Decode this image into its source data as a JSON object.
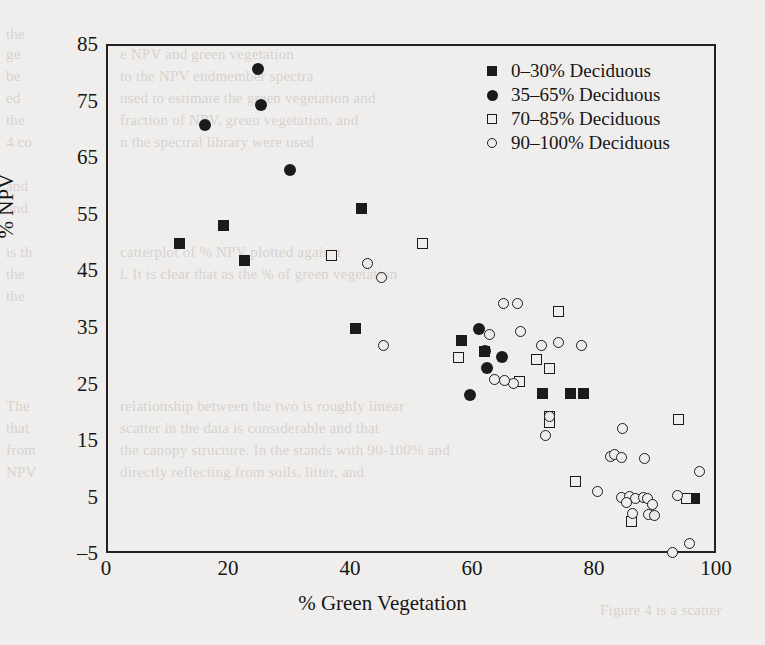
{
  "chart_data": {
    "type": "scatter",
    "title": "",
    "xlabel": "% Green Vegetation",
    "ylabel": "% NPV",
    "xlim": [
      0,
      100
    ],
    "ylim": [
      -5,
      85
    ],
    "xticks": [
      "0",
      "20",
      "40",
      "60",
      "80",
      "100"
    ],
    "yticks": [
      "85",
      "75",
      "65",
      "55",
      "45",
      "35",
      "25",
      "15",
      "5",
      "-5"
    ],
    "grid": false,
    "legend_position": "top-right",
    "series": [
      {
        "name": "0-30% Deciduous",
        "marker": "filled-square",
        "color": "#1b1b1b",
        "points": [
          [
            11.8,
            50.1
          ],
          [
            19.0,
            53.3
          ],
          [
            22.3,
            47.0
          ],
          [
            41.5,
            56.2
          ],
          [
            40.5,
            35.0
          ],
          [
            58.0,
            33.0
          ],
          [
            61.8,
            31.0
          ],
          [
            71.3,
            23.5
          ],
          [
            75.9,
            23.5
          ],
          [
            78.0,
            23.5
          ],
          [
            96.2,
            5.0
          ]
        ]
      },
      {
        "name": "35-65% Deciduous",
        "marker": "filled-circle",
        "color": "#1b1b1b",
        "points": [
          [
            24.6,
            81.0
          ],
          [
            25.1,
            74.6
          ],
          [
            15.9,
            71.0
          ],
          [
            29.8,
            63.0
          ],
          [
            60.8,
            35.0
          ],
          [
            61.8,
            31.0
          ],
          [
            64.6,
            30.0
          ],
          [
            62.1,
            28.0
          ],
          [
            59.4,
            23.3
          ]
        ]
      },
      {
        "name": "70-85% Deciduous",
        "marker": "open-square",
        "color": "#1b1b1b",
        "points": [
          [
            51.6,
            50.0
          ],
          [
            36.6,
            48.0
          ],
          [
            57.5,
            30.0
          ],
          [
            73.9,
            38.0
          ],
          [
            70.2,
            29.5
          ],
          [
            72.3,
            28.0
          ],
          [
            67.4,
            25.6
          ],
          [
            72.3,
            19.5
          ],
          [
            72.3,
            18.5
          ],
          [
            76.7,
            8.0
          ],
          [
            93.5,
            19.0
          ],
          [
            85.8,
            1.0
          ],
          [
            94.9,
            5.0
          ]
        ]
      },
      {
        "name": "90-100% Deciduous",
        "marker": "open-circle",
        "color": "#1b1b1b",
        "points": [
          [
            42.6,
            46.5
          ],
          [
            44.9,
            44.0
          ],
          [
            45.1,
            32.0
          ],
          [
            64.8,
            39.5
          ],
          [
            67.2,
            39.5
          ],
          [
            62.6,
            34.0
          ],
          [
            67.7,
            34.5
          ],
          [
            71.1,
            32.0
          ],
          [
            73.9,
            32.5
          ],
          [
            77.7,
            32.0
          ],
          [
            63.3,
            26.0
          ],
          [
            66.4,
            25.3
          ],
          [
            65.0,
            25.8
          ],
          [
            72.3,
            19.5
          ],
          [
            71.8,
            16.2
          ],
          [
            84.4,
            17.3
          ],
          [
            82.3,
            12.5
          ],
          [
            83.1,
            12.8
          ],
          [
            84.1,
            12.2
          ],
          [
            87.9,
            12.0
          ],
          [
            80.2,
            6.3
          ],
          [
            84.1,
            5.2
          ],
          [
            85.5,
            5.4
          ],
          [
            86.4,
            5.0
          ],
          [
            87.8,
            5.2
          ],
          [
            88.4,
            5.0
          ],
          [
            89.2,
            4.0
          ],
          [
            85.0,
            4.3
          ],
          [
            86.0,
            2.4
          ],
          [
            88.6,
            2.2
          ],
          [
            89.6,
            2.0
          ],
          [
            93.4,
            5.5
          ],
          [
            96.9,
            9.8
          ],
          [
            92.5,
            -4.5
          ],
          [
            95.4,
            -3.0
          ]
        ]
      }
    ]
  },
  "legend": {
    "entries": [
      {
        "label": "0–30% Deciduous",
        "marker": "filled-square"
      },
      {
        "label": "35–65% Deciduous",
        "marker": "filled-circle"
      },
      {
        "label": "70–85% Deciduous",
        "marker": "open-square"
      },
      {
        "label": "90–100% Deciduous",
        "marker": "open-circle"
      }
    ]
  },
  "axes": {
    "x_label": "% Green Vegetation",
    "y_label": "% NPV",
    "x_ticks": [
      "0",
      "20",
      "40",
      "60",
      "80",
      "100"
    ],
    "y_ticks": [
      "85",
      "75",
      "65",
      "55",
      "45",
      "35",
      "25",
      "15",
      "5",
      "–5"
    ]
  },
  "page_bleed": {
    "lines": [
      "the the",
      "in images of NPV and green vegetation",
      "of the NPV endmember spectra were",
      "were used to estimate the green vegetation and",
      "of the fraction of NPV, green vegetation, and",
      "in the spectral library were used",
      "Figure 4 is a scatterplot of % NPV plotted against the",
      "level. It is clear that as the % of green vegetation in",
      "of the canopy decreases, the NPV increases",
      "that a simple linear relationship does not",
      "relationship between the two is roughly linear",
      "the scatter in the data is considerable and that",
      "the canopy structure. In the stands with 90-100% and",
      "% and that the directly reflecting from soils, litter, and",
      "Figure 4 is a scatterplot"
    ]
  }
}
